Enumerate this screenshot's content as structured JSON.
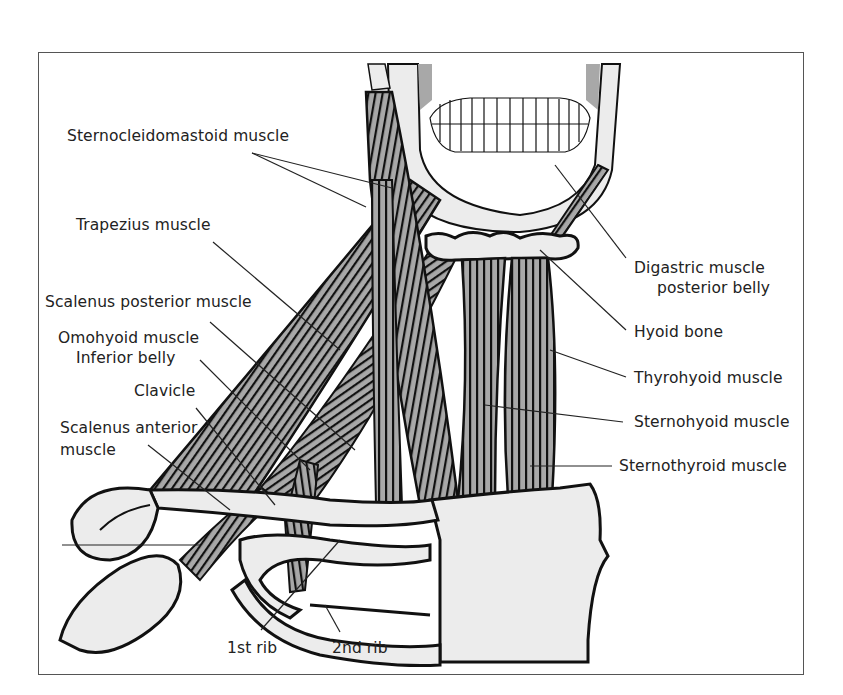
{
  "figure": {
    "colors": {
      "outline": "#111111",
      "muscle_fill": "#a8a8a8",
      "bone_fill": "#ececec",
      "leader": "#222222",
      "frame": "#555555"
    }
  },
  "labels": {
    "scm": "Sternocleidomastoid muscle",
    "trapezius": "Trapezius muscle",
    "scalenus_posterior": "Scalenus posterior muscle",
    "omohyoid_1": "Omohyoid muscle",
    "omohyoid_2": "Inferior belly",
    "clavicle": "Clavicle",
    "scalenus_anterior_1": "Scalenus anterior",
    "scalenus_anterior_2": "muscle",
    "digastric_1": "Digastric muscle",
    "digastric_2": "posterior belly",
    "hyoid": "Hyoid bone",
    "thyrohyoid": "Thyrohyoid muscle",
    "sternohyoid": "Sternohyoid muscle",
    "sternothyroid": "Sternothyroid muscle",
    "rib1": "1st rib",
    "rib2": "2nd rib"
  }
}
